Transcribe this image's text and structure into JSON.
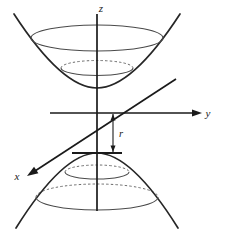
{
  "figure": {
    "kind": "3d-coordinate-diagram",
    "title_visible": false,
    "background_color": "#ffffff",
    "stroke_color": "#1a1a1a",
    "surface_stroke_color": "#3d3d3d",
    "dashed_stroke_color": "#555555"
  },
  "axes": {
    "origin": {
      "x": 97,
      "y": 113
    },
    "z": {
      "label": "z",
      "label_x": 101,
      "label_y": 12,
      "line": {
        "x1": 97,
        "y1": 14,
        "x2": 97,
        "y2": 211
      },
      "has_arrow": false
    },
    "y": {
      "label": "y",
      "label_x": 208,
      "label_y": 117,
      "line": {
        "x1": 50,
        "y1": 113,
        "x2": 196,
        "y2": 113
      },
      "has_arrow": true,
      "arrow_tip": {
        "x": 202,
        "y": 113
      },
      "arrow_dir": "right"
    },
    "x": {
      "label": "x",
      "label_x": 17,
      "label_y": 180,
      "line": {
        "x1": 176,
        "y1": 79,
        "x2": 35,
        "y2": 171
      },
      "has_arrow": true,
      "arrow_tip": {
        "x": 27,
        "y": 176
      },
      "arrow_dir": "down-left"
    }
  },
  "surface": {
    "name": "hyperboloid-of-two-sheets",
    "upper_nappe": {
      "vertex": {
        "x": 97,
        "y": 88
      },
      "rim_ellipse": {
        "cx": 97,
        "cy": 38,
        "rx": 66,
        "ry": 13,
        "style": "solid"
      },
      "inner_ellipse": {
        "cx": 97,
        "cy": 68,
        "rx": 36,
        "ry": 7.5,
        "back_style": "dashed",
        "front_style": "solid"
      },
      "left_branch": {
        "x_top": 14,
        "y_top": 14,
        "x_vertex": 97,
        "y_vertex": 88
      },
      "right_branch": {
        "x_top": 180,
        "y_top": 14,
        "x_vertex": 97,
        "y_vertex": 88
      }
    },
    "lower_nappe": {
      "vertex": {
        "x": 97,
        "y": 153
      },
      "vertex_tick": {
        "x1": 72,
        "y1": 153,
        "x2": 122,
        "y2": 153
      },
      "inner_ellipse": {
        "cx": 97,
        "cy": 172,
        "rx": 32,
        "ry": 7,
        "back_style": "dashed",
        "front_style": "solid"
      },
      "outer_ellipse": {
        "cx": 97,
        "cy": 197,
        "rx": 61,
        "ry": 13,
        "back_style": "dashed",
        "front_style": "solid"
      },
      "left_branch": {
        "x_bottom": 16,
        "y_bottom": 228,
        "x_vertex": 97,
        "y_vertex": 153
      },
      "right_branch": {
        "x_bottom": 178,
        "y_bottom": 228,
        "x_vertex": 97,
        "y_vertex": 153
      }
    }
  },
  "dimension": {
    "label": "r",
    "label_x": 121,
    "label_y": 137,
    "measures": "distance-from-origin-to-lower-vertex",
    "arrow_x": 113,
    "arrow_top_y": 114,
    "arrow_bottom_y": 152,
    "double_headed": true
  },
  "labels": {
    "z_axis": "z",
    "y_axis": "y",
    "x_axis": "x",
    "radius": "r"
  }
}
